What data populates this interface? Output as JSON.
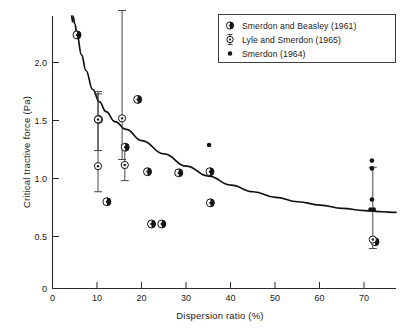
{
  "chart_data": {
    "type": "scatter",
    "title": "",
    "xlabel": "Dispersion ratio (%)",
    "ylabel": "Critical tractive force (Pa)",
    "xlim": [
      0,
      77
    ],
    "ylim": [
      0,
      2.45
    ],
    "xticks": [
      0,
      10,
      20,
      30,
      40,
      50,
      60,
      70
    ],
    "xtick_labels": [
      "0",
      "10",
      "20",
      "30",
      "40",
      "50",
      "60",
      "70"
    ],
    "yticks": [
      0,
      0.5,
      1.0,
      1.5,
      2.0
    ],
    "ytick_labels": [
      "0",
      "0.5",
      "1.0",
      "1.5",
      "2.0"
    ],
    "grid": false,
    "legend_position": "top-right",
    "series": [
      {
        "name": "Smerdon and Beasley (1961)",
        "marker": "half-filled-circle",
        "points": [
          {
            "x": 5.5,
            "y": 2.28
          },
          {
            "x": 10.3,
            "y": 1.52
          },
          {
            "x": 12.2,
            "y": 0.78
          },
          {
            "x": 16.3,
            "y": 1.27
          },
          {
            "x": 19.1,
            "y": 1.7
          },
          {
            "x": 21.3,
            "y": 1.05
          },
          {
            "x": 22.2,
            "y": 0.58
          },
          {
            "x": 24.5,
            "y": 0.58
          },
          {
            "x": 28.3,
            "y": 1.04
          },
          {
            "x": 35.3,
            "y": 1.05
          },
          {
            "x": 35.4,
            "y": 0.77
          },
          {
            "x": 72.3,
            "y": 0.42
          }
        ]
      },
      {
        "name": "Lyle and Smerdon (1965)",
        "marker": "open-circle-with-error-bar",
        "points": [
          {
            "x": 10.2,
            "y": 1.52,
            "yerr_low": 0.28,
            "yerr_high": 0.25
          },
          {
            "x": 10.2,
            "y": 1.1,
            "yerr_low": 0.23,
            "yerr_high": 0.65
          },
          {
            "x": 15.6,
            "y": 1.53,
            "yerr_low": 0.37,
            "yerr_high": 0.97
          },
          {
            "x": 16.2,
            "y": 1.11,
            "yerr_low": 0.14,
            "yerr_high": 0.18
          },
          {
            "x": 71.8,
            "y": 0.44,
            "yerr_low": 0.08,
            "yerr_high": 0.65
          }
        ]
      },
      {
        "name": "Smerdon (1964)",
        "marker": "small-filled-dot",
        "points": [
          {
            "x": 35.1,
            "y": 1.29
          },
          {
            "x": 71.6,
            "y": 1.15
          },
          {
            "x": 71.6,
            "y": 1.08
          },
          {
            "x": 71.6,
            "y": 0.8
          },
          {
            "x": 71.3,
            "y": 0.71
          },
          {
            "x": 72.0,
            "y": 0.71
          }
        ]
      }
    ],
    "fit_curve": {
      "name": "fitted-trend-curve",
      "description": "Decaying power-law trend of critical tractive force versus dispersion ratio",
      "points": [
        {
          "x": 4.6,
          "y": 2.45
        },
        {
          "x": 5.0,
          "y": 2.38
        },
        {
          "x": 5.5,
          "y": 2.28
        },
        {
          "x": 6.5,
          "y": 2.1
        },
        {
          "x": 7.5,
          "y": 1.96
        },
        {
          "x": 9.0,
          "y": 1.79
        },
        {
          "x": 10.5,
          "y": 1.68
        },
        {
          "x": 12.0,
          "y": 1.59
        },
        {
          "x": 14.0,
          "y": 1.5
        },
        {
          "x": 16.5,
          "y": 1.43
        },
        {
          "x": 20.0,
          "y": 1.33
        },
        {
          "x": 25.0,
          "y": 1.21
        },
        {
          "x": 30.0,
          "y": 1.1
        },
        {
          "x": 35.0,
          "y": 1.01
        },
        {
          "x": 40.0,
          "y": 0.93
        },
        {
          "x": 45.0,
          "y": 0.87
        },
        {
          "x": 50.0,
          "y": 0.82
        },
        {
          "x": 55.0,
          "y": 0.78
        },
        {
          "x": 60.0,
          "y": 0.75
        },
        {
          "x": 65.0,
          "y": 0.72
        },
        {
          "x": 70.0,
          "y": 0.7
        },
        {
          "x": 74.0,
          "y": 0.69
        },
        {
          "x": 77.0,
          "y": 0.685
        }
      ],
      "dashed_head": [
        {
          "x": 4.3,
          "y": 2.45
        },
        {
          "x": 4.5,
          "y": 2.4
        }
      ]
    },
    "colors": {
      "axis": "#2b2b2b",
      "curve": "#111111",
      "marker_fill": "#141414",
      "marker_light": "#ffffff",
      "error_bar": "#333333",
      "background": "#ffffff"
    }
  },
  "legend": {
    "entries": [
      {
        "label": "Smerdon and Beasley (1961)",
        "marker": "half-filled-circle"
      },
      {
        "label": "Lyle and Smerdon (1965)",
        "marker": "open-circle-with-error-bar"
      },
      {
        "label": "Smerdon (1964)",
        "marker": "small-filled-dot"
      }
    ]
  }
}
